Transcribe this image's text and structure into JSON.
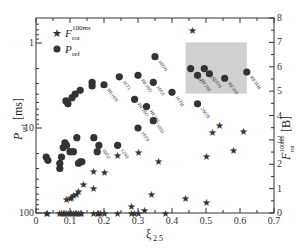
{
  "chart_data": {
    "type": "scatter",
    "title": "",
    "xlabel": "ξ",
    "xlabel_sub": "2.5",
    "ylabel_left": "P",
    "ylabel_left_sub": "ref",
    "ylabel_left_unit": "[ms]",
    "ylabel_right": "F",
    "ylabel_right_sub": "rot",
    "ylabel_right_sup": "100ms",
    "ylabel_right_unit": "[B]",
    "xlim": [
      0,
      0.7
    ],
    "ylim_left": [
      100,
      1
    ],
    "ylim_left_scale": "log-inverted",
    "ylim_right": [
      0,
      8
    ],
    "x_ticks": [
      "0",
      "0.1",
      "0.2",
      "0.3",
      "0.4",
      "0.5",
      "0.6",
      "0.7"
    ],
    "y_left_ticks": [
      "1",
      "10",
      "100"
    ],
    "y_right_ticks": [
      "0",
      "1",
      "2",
      "3",
      "4",
      "5",
      "6",
      "7",
      "8"
    ],
    "grid": false,
    "legend_position": "top-left",
    "shaded_region": {
      "x": [
        0.44,
        0.62
      ],
      "y_right": [
        4.9,
        7.0
      ]
    },
    "series": [
      {
        "name": "F_rot^100ms",
        "legend_main": "F",
        "legend_sub": "rot",
        "legend_sup": "100ms",
        "marker": "star",
        "axis": "right",
        "points": [
          [
            0.03,
            0
          ],
          [
            0.035,
            0
          ],
          [
            0.07,
            0
          ],
          [
            0.075,
            0
          ],
          [
            0.08,
            0
          ],
          [
            0.085,
            0
          ],
          [
            0.09,
            0
          ],
          [
            0.095,
            0
          ],
          [
            0.1,
            0
          ],
          [
            0.105,
            0
          ],
          [
            0.11,
            0
          ],
          [
            0.115,
            0
          ],
          [
            0.12,
            0
          ],
          [
            0.125,
            0
          ],
          [
            0.13,
            0
          ],
          [
            0.135,
            0
          ],
          [
            0.17,
            0
          ],
          [
            0.18,
            0
          ],
          [
            0.185,
            0
          ],
          [
            0.19,
            0
          ],
          [
            0.2,
            0
          ],
          [
            0.24,
            0
          ],
          [
            0.28,
            0
          ],
          [
            0.29,
            0
          ],
          [
            0.3,
            0
          ],
          [
            0.38,
            0
          ],
          [
            0.09,
            0.55
          ],
          [
            0.1,
            0.6
          ],
          [
            0.105,
            0.65
          ],
          [
            0.11,
            0.7
          ],
          [
            0.12,
            0.75
          ],
          [
            0.125,
            0.9
          ],
          [
            0.14,
            1.15
          ],
          [
            0.17,
            1.0
          ],
          [
            0.17,
            1.7
          ],
          [
            0.2,
            1.65
          ],
          [
            0.24,
            2.35
          ],
          [
            0.28,
            0.25
          ],
          [
            0.3,
            2.5
          ],
          [
            0.32,
            0.1
          ],
          [
            0.34,
            0.75
          ],
          [
            0.36,
            2.1
          ],
          [
            0.44,
            0.6
          ],
          [
            0.5,
            0.45
          ],
          [
            0.5,
            2.3
          ],
          [
            0.52,
            3.3
          ],
          [
            0.54,
            3.6
          ],
          [
            0.58,
            2.55
          ],
          [
            0.61,
            3.35
          ],
          [
            0.46,
            7.5
          ]
        ]
      },
      {
        "name": "P_ref",
        "legend_main": "P",
        "legend_sub": "ref",
        "marker": "circle",
        "axis": "left",
        "points": [
          {
            "x": 0.03,
            "y": 22,
            "label": ""
          },
          {
            "x": 0.035,
            "y": 24,
            "label": ""
          },
          {
            "x": 0.07,
            "y": 26,
            "label": ""
          },
          {
            "x": 0.07,
            "y": 30,
            "label": ""
          },
          {
            "x": 0.075,
            "y": 22,
            "label": ""
          },
          {
            "x": 0.08,
            "y": 17,
            "label": ""
          },
          {
            "x": 0.085,
            "y": 15,
            "label": ""
          },
          {
            "x": 0.09,
            "y": 16,
            "label": ""
          },
          {
            "x": 0.1,
            "y": 19,
            "label": ""
          },
          {
            "x": 0.11,
            "y": 19,
            "label": ""
          },
          {
            "x": 0.12,
            "y": 13,
            "label": ""
          },
          {
            "x": 0.125,
            "y": 26,
            "label": ""
          },
          {
            "x": 0.13,
            "y": 25,
            "label": ""
          },
          {
            "x": 0.135,
            "y": 25,
            "label": ""
          },
          {
            "x": 0.17,
            "y": 13,
            "label": ""
          },
          {
            "x": 0.18,
            "y": 19,
            "label": ""
          },
          {
            "x": 0.185,
            "y": 16,
            "label": "16O2"
          },
          {
            "x": 0.24,
            "y": 16,
            "label": "12S0"
          },
          {
            "x": 0.3,
            "y": 10,
            "label": "16T0"
          },
          {
            "x": 0.088,
            "y": 4.8,
            "label": ""
          },
          {
            "x": 0.094,
            "y": 5.2,
            "label": ""
          },
          {
            "x": 0.106,
            "y": 4.4,
            "label": ""
          },
          {
            "x": 0.115,
            "y": 4.0,
            "label": ""
          },
          {
            "x": 0.13,
            "y": 3.6,
            "label": ""
          },
          {
            "x": 0.165,
            "y": 2.9,
            "label": ""
          },
          {
            "x": 0.165,
            "y": 3.2,
            "label": ""
          },
          {
            "x": 0.2,
            "y": 3.1,
            "label": "HE16N"
          },
          {
            "x": 0.245,
            "y": 2.5,
            "label": "16T1"
          },
          {
            "x": 0.3,
            "y": 2.4,
            "label": "HE16O"
          },
          {
            "x": 0.29,
            "y": 4.6,
            "label": "HE16O"
          },
          {
            "x": 0.325,
            "y": 5.6,
            "label": "HE16L"
          },
          {
            "x": 0.35,
            "y": 1.45,
            "label": "16ON"
          },
          {
            "x": 0.345,
            "y": 2.9,
            "label": "16O1"
          },
          {
            "x": 0.345,
            "y": 8.2,
            "label": "16S1"
          },
          {
            "x": 0.4,
            "y": 3.8,
            "label": "16TH"
          },
          {
            "x": 0.455,
            "y": 2.0,
            "label": "16OC"
          },
          {
            "x": 0.475,
            "y": 2.4,
            "label": "HE16E"
          },
          {
            "x": 0.495,
            "y": 2.0,
            "label": "12T1"
          },
          {
            "x": 0.51,
            "y": 2.3,
            "label": "25ON"
          },
          {
            "x": 0.555,
            "y": 2.6,
            "label": "HE16P"
          },
          {
            "x": 0.62,
            "y": 2.2,
            "label": "HE16H"
          },
          {
            "x": 0.475,
            "y": 5.2,
            "label": "26ON"
          }
        ]
      }
    ]
  }
}
